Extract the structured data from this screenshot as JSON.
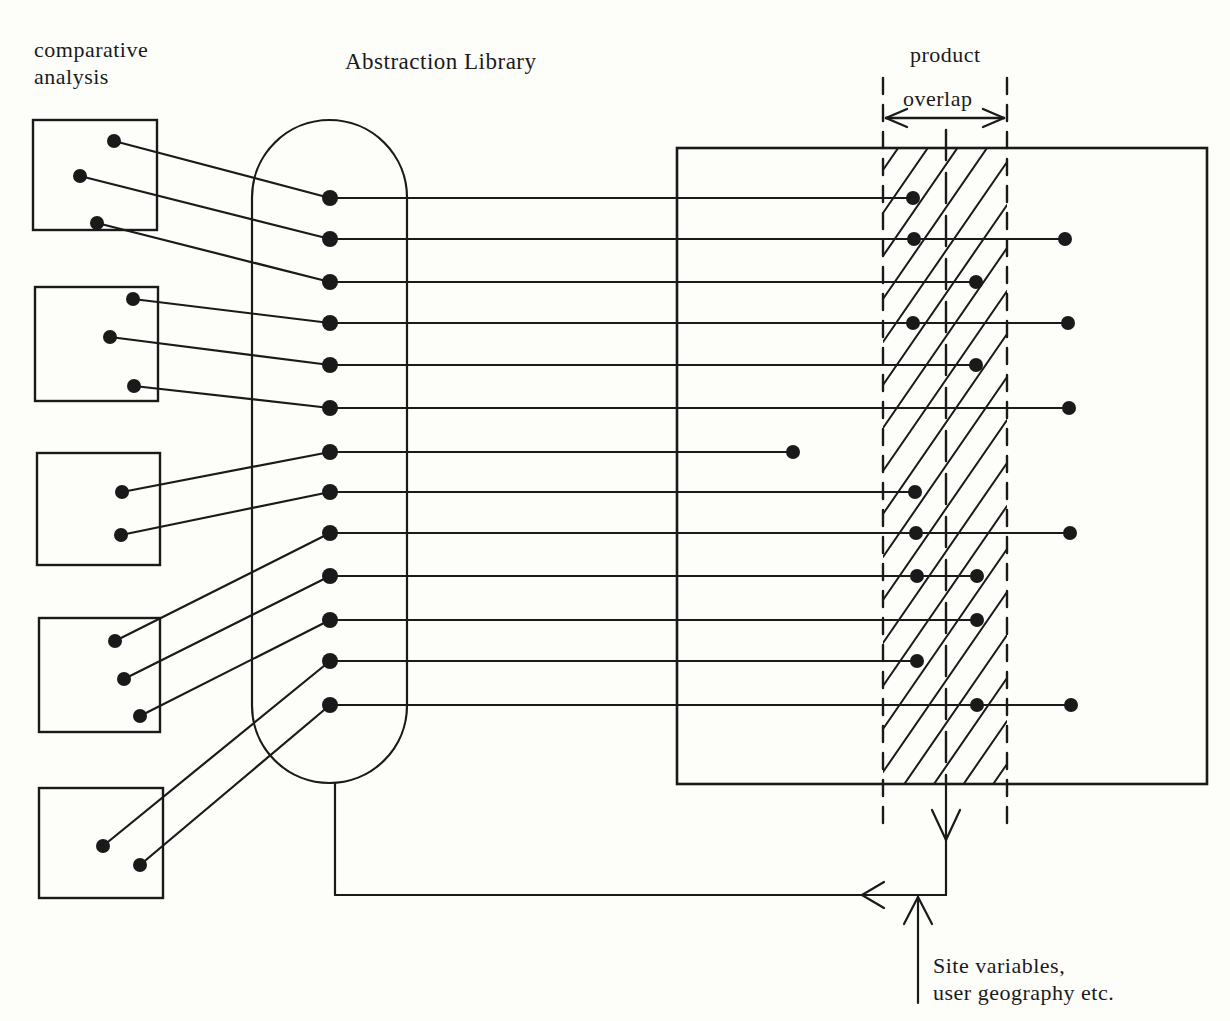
{
  "labels": {
    "comparative_line1": "comparative",
    "comparative_line2": "analysis",
    "abstraction_library": "Abstraction Library",
    "product": "product",
    "overlap": "overlap",
    "site_line1": "Site variables,",
    "site_line2": "user geography etc."
  },
  "colors": {
    "ink": "#1a1a1a",
    "paper": "#fdfdfa"
  },
  "diagram": {
    "stroke_width": 2.2,
    "dot_r_small": 6.5,
    "dot_r_lib": 8,
    "analysis_boxes": [
      {
        "x": 33,
        "y": 120,
        "w": 124,
        "h": 110,
        "dots": [
          [
            114,
            141
          ],
          [
            80,
            176
          ],
          [
            97,
            223
          ]
        ]
      },
      {
        "x": 35,
        "y": 287,
        "w": 123,
        "h": 114,
        "dots": [
          [
            133,
            299
          ],
          [
            110,
            337
          ],
          [
            134,
            386
          ]
        ]
      },
      {
        "x": 37,
        "y": 453,
        "w": 123,
        "h": 112,
        "dots": [
          [
            122,
            492
          ],
          [
            121,
            535
          ]
        ]
      },
      {
        "x": 39,
        "y": 618,
        "w": 121,
        "h": 114,
        "dots": [
          [
            115,
            641
          ],
          [
            124,
            679
          ],
          [
            140,
            716
          ]
        ]
      },
      {
        "x": 39,
        "y": 788,
        "w": 124,
        "h": 110,
        "dots": [
          [
            103,
            846
          ],
          [
            140,
            865
          ]
        ]
      }
    ],
    "library": {
      "x": 252,
      "y": 120,
      "w": 155,
      "h": 663,
      "dot_x": 330,
      "dots_y": [
        198,
        239,
        282,
        323,
        365,
        408,
        452,
        492,
        533,
        576,
        620,
        661,
        705
      ]
    },
    "product_box": {
      "x": 677,
      "y": 148,
      "w": 530,
      "h": 636
    },
    "overlap_band": {
      "left": 883,
      "center": 946,
      "right": 1007,
      "dash_top": 78,
      "dash_bottom": 826,
      "arrow_y": 118,
      "hatch_step": 43,
      "hatch_rise": 180
    },
    "right_rows": [
      {
        "y": 198,
        "end_x": 913,
        "dots": [
          913
        ]
      },
      {
        "y": 239,
        "end_x": 1065,
        "dots": [
          914,
          1065
        ]
      },
      {
        "y": 282,
        "end_x": 976,
        "dots": [
          976
        ]
      },
      {
        "y": 323,
        "end_x": 1068,
        "dots": [
          913,
          1068
        ]
      },
      {
        "y": 365,
        "end_x": 976,
        "dots": [
          976
        ]
      },
      {
        "y": 408,
        "end_x": 1069,
        "dots": [
          1069
        ]
      },
      {
        "y": 452,
        "end_x": 793,
        "dots": [
          793
        ]
      },
      {
        "y": 492,
        "end_x": 915,
        "dots": [
          915
        ]
      },
      {
        "y": 533,
        "end_x": 1070,
        "dots": [
          916,
          1070
        ]
      },
      {
        "y": 576,
        "end_x": 977,
        "dots": [
          917,
          977
        ]
      },
      {
        "y": 620,
        "end_x": 977,
        "dots": [
          977
        ]
      },
      {
        "y": 661,
        "end_x": 917,
        "dots": [
          917
        ]
      },
      {
        "y": 705,
        "end_x": 1071,
        "dots": [
          977,
          1071
        ]
      }
    ],
    "feedback": {
      "down_x": 946,
      "rect_bottom": 784,
      "h_y": 895,
      "left_x": 335,
      "capsule_bottom": 783,
      "down_arrow_tip_y": 840,
      "left_arrow_tip_x": 862,
      "site_arrow": {
        "x": 918,
        "bottom": 1003,
        "top": 897
      }
    }
  }
}
